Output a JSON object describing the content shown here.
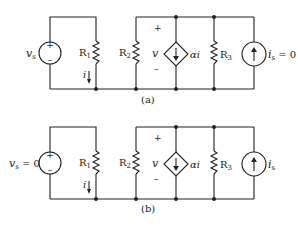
{
  "diagram": {
    "type": "circuit-schematic",
    "circuits": [
      {
        "caption": "(a)",
        "voltage_source": {
          "label": "v",
          "sub": "s",
          "value": "",
          "plus": "+",
          "minus": "–"
        },
        "resistors": [
          {
            "label": "R",
            "sub": "1"
          },
          {
            "label": "R",
            "sub": "2"
          },
          {
            "label": "R",
            "sub": "3"
          }
        ],
        "current_label": "i",
        "voltage_label": {
          "plus": "+",
          "name": "v",
          "minus": "–"
        },
        "dependent_source": {
          "label": "αi"
        },
        "current_source": {
          "label": "i",
          "sub": "s",
          "value": " = 0"
        }
      },
      {
        "caption": "(b)",
        "voltage_source": {
          "label": "v",
          "sub": "s",
          "value": " = 0",
          "plus": "+",
          "minus": "–"
        },
        "resistors": [
          {
            "label": "R",
            "sub": "1"
          },
          {
            "label": "R",
            "sub": "2"
          },
          {
            "label": "R",
            "sub": "3"
          }
        ],
        "current_label": "i",
        "voltage_label": {
          "plus": "+",
          "name": "v",
          "minus": "–"
        },
        "dependent_source": {
          "label": "αi"
        },
        "current_source": {
          "label": "i",
          "sub": "s",
          "value": ""
        }
      }
    ]
  }
}
